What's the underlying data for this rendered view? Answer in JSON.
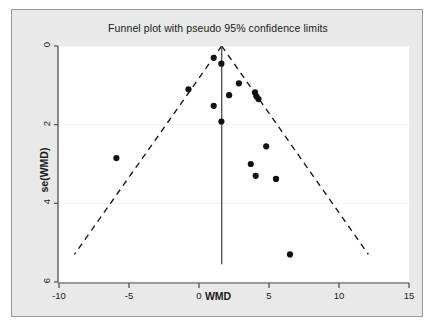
{
  "chart_data": {
    "type": "scatter",
    "title": "Funnel plot with pseudo 95% confidence limits",
    "xlabel": "WMD",
    "ylabel": "se(WMD)",
    "xlim": [
      -10,
      15
    ],
    "ylim": [
      0,
      6
    ],
    "y_inverted": true,
    "grid": true,
    "legend": "none",
    "xticks": [
      -10,
      -5,
      0,
      5,
      10,
      15
    ],
    "xtick_labels": [
      "-10",
      "-5",
      "0",
      "5",
      "10",
      "15"
    ],
    "yticks": [
      0,
      2,
      4,
      6
    ],
    "ytick_labels": [
      "0",
      "2",
      "4",
      "6"
    ],
    "points": [
      {
        "x": 1.05,
        "y": 0.3
      },
      {
        "x": 1.6,
        "y": 0.45
      },
      {
        "x": -0.75,
        "y": 1.1
      },
      {
        "x": 2.85,
        "y": 0.95
      },
      {
        "x": 2.15,
        "y": 1.25
      },
      {
        "x": 4.0,
        "y": 1.18
      },
      {
        "x": 4.1,
        "y": 1.28
      },
      {
        "x": 4.25,
        "y": 1.35
      },
      {
        "x": 1.05,
        "y": 1.52
      },
      {
        "x": 1.6,
        "y": 1.92
      },
      {
        "x": -5.9,
        "y": 2.85
      },
      {
        "x": 4.8,
        "y": 2.55
      },
      {
        "x": 3.7,
        "y": 3.0
      },
      {
        "x": 4.05,
        "y": 3.3
      },
      {
        "x": 5.5,
        "y": 3.38
      },
      {
        "x": 6.5,
        "y": 5.3
      }
    ],
    "reference_line": {
      "name": "pooled-effect-line",
      "x": 1.62,
      "y_start": 0.0,
      "y_end": 5.55,
      "style": "solid"
    },
    "pseudo_95_limits": {
      "name": "pseudo-95-confidence-limits",
      "style": "dashed",
      "apex": {
        "x": 1.62,
        "y": 0.0
      },
      "left_end": {
        "x": -8.9,
        "y": 5.3
      },
      "right_end": {
        "x": 12.1,
        "y": 5.3
      }
    },
    "series_name": "studies",
    "marker": {
      "shape": "circle",
      "color": "#111111",
      "size": 5
    }
  },
  "colors": {
    "panel_background": "#e9e9e9",
    "plot_background": "#ffffff",
    "panel_border": "#9a9a9a",
    "axis": "#4a4a4a",
    "text": "#1a1a1a",
    "marker": "#111111",
    "grid": "#f0f0f0",
    "reference_line": "#555555",
    "limit_line": "#1a1a1a"
  }
}
